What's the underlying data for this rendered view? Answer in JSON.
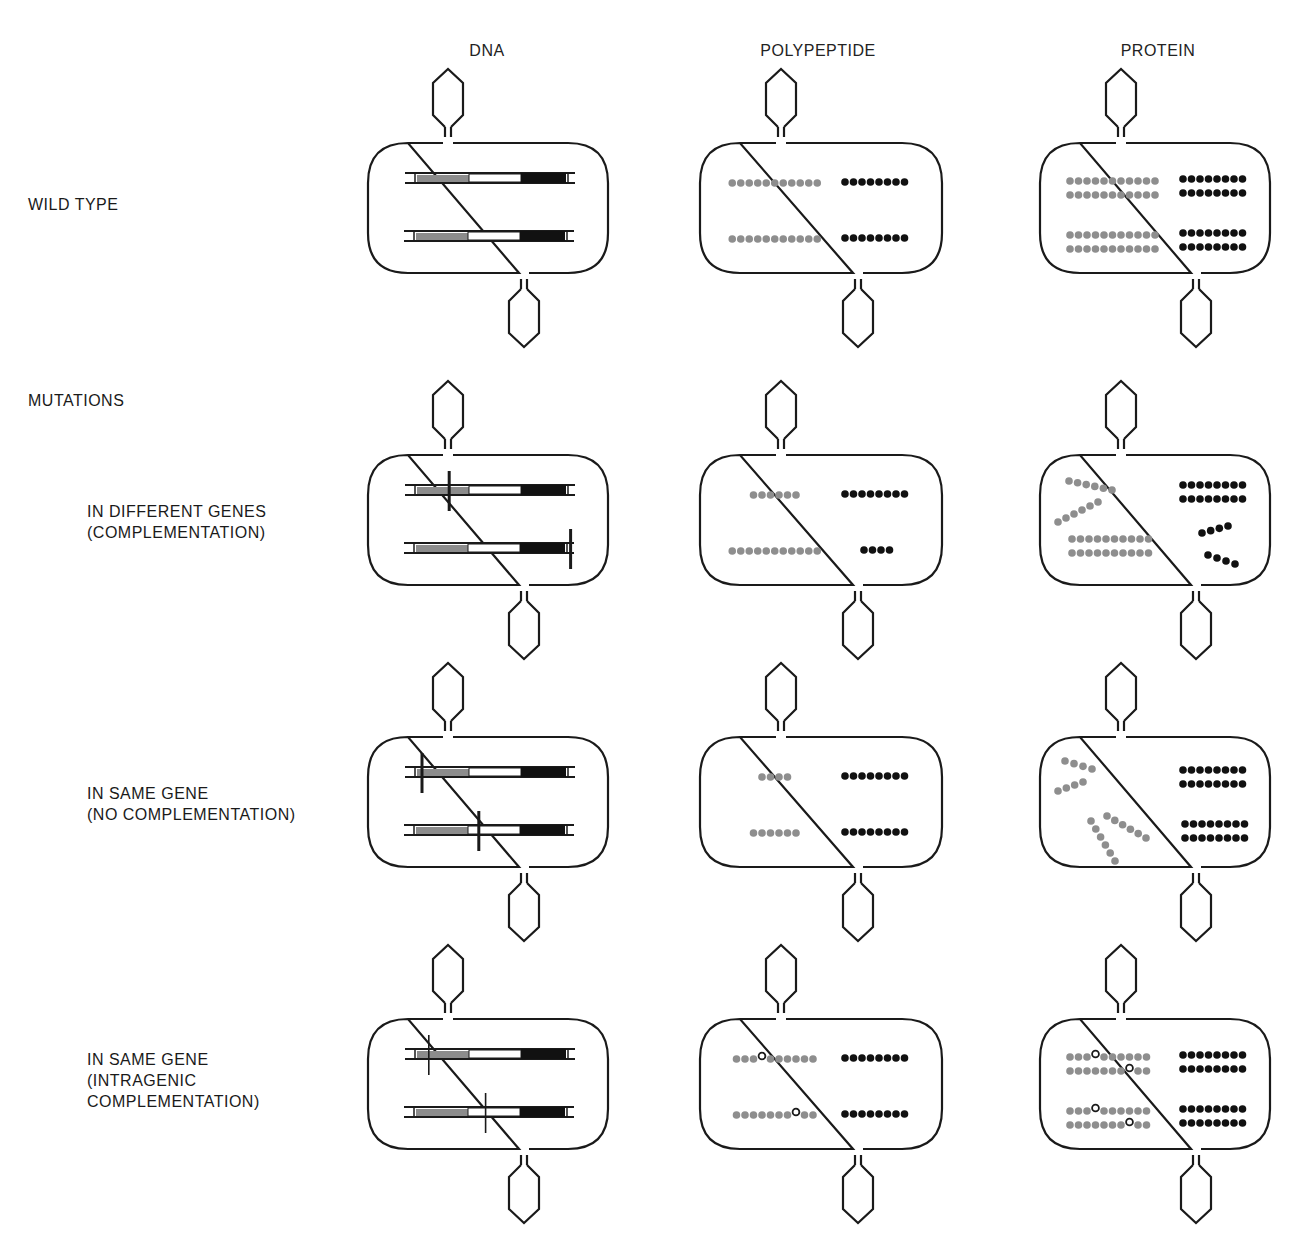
{
  "columns": [
    {
      "id": "dna",
      "label": "DNA",
      "center_x": 487
    },
    {
      "id": "polypeptide",
      "label": "POLYPEPTIDE",
      "center_x": 818
    },
    {
      "id": "protein",
      "label": "PROTEIN",
      "center_x": 1158
    }
  ],
  "sections": {
    "wild_type": {
      "label": "WILD TYPE",
      "y": 194
    },
    "mutations": {
      "label": "MUTATIONS",
      "y": 390
    }
  },
  "rows": [
    {
      "id": "wild-type",
      "label": "",
      "cell_top": 143,
      "dna": {
        "genes": [
          {
            "mutations": []
          },
          {
            "mutations": []
          }
        ]
      },
      "polypeptide": {
        "lines": [
          {
            "gray": 11,
            "gray_gap_at": null,
            "black": 8
          },
          {
            "gray": 11,
            "gray_gap_at": null,
            "black": 8
          }
        ]
      },
      "protein": {
        "type": "dimers",
        "gray_per_strand": 11,
        "black_per_strand": 8,
        "open_positions": []
      }
    },
    {
      "id": "different-genes",
      "label": "IN DIFFERENT GENES\n(COMPLEMENTATION)",
      "cell_top": 455,
      "dna": {
        "genes": [
          {
            "mutations": [
              {
                "gene": "A",
                "pos": 0.13
              }
            ]
          },
          {
            "mutations": [
              {
                "gene": "B",
                "pos": 0.49
              }
            ]
          }
        ]
      },
      "polypeptide": {
        "lines": [
          {
            "gray": 6,
            "black": 8
          },
          {
            "gray": 11,
            "black": 4
          }
        ]
      },
      "protein": {
        "type": "complementation"
      }
    },
    {
      "id": "same-gene",
      "label": "IN SAME GENE\n(NO COMPLEMENTATION)",
      "cell_top": 737,
      "dna": {
        "genes": [
          {
            "mutations": [
              {
                "gene": "A",
                "pos": 0.05
              }
            ]
          },
          {
            "mutations": [
              {
                "gene": "A",
                "pos": 0.22
              }
            ]
          }
        ]
      },
      "polypeptide": {
        "lines": [
          {
            "gray": 4,
            "black": 8
          },
          {
            "gray": 6,
            "black": 8
          }
        ]
      },
      "protein": {
        "type": "no-complementation"
      }
    },
    {
      "id": "intragenic",
      "label": "IN SAME GENE\n(INTRAGENIC\nCOMPLEMENTATION)",
      "cell_top": 1019,
      "dna": {
        "genes": [
          {
            "mutations": [
              {
                "gene": "A",
                "pos": 0.07,
                "thin": true
              }
            ]
          },
          {
            "mutations": [
              {
                "gene": "A",
                "pos": 0.24,
                "thin": true
              }
            ]
          }
        ]
      },
      "polypeptide": {
        "lines": [
          {
            "gray": 10,
            "open_at": 3,
            "black": 8
          },
          {
            "gray": 10,
            "open_at": 7,
            "black": 8
          }
        ]
      },
      "protein": {
        "type": "intragenic",
        "gray_per_strand": 10,
        "black_per_strand": 8,
        "open_positions": [
          3,
          7
        ]
      }
    }
  ],
  "colors": {
    "outline": "#1a1a1a",
    "gene_a_gray": "#8c8c8c",
    "gene_b_black": "#111111",
    "gray_dot": "#8e8e8e",
    "black_dot": "#111111",
    "background": "#ffffff"
  }
}
